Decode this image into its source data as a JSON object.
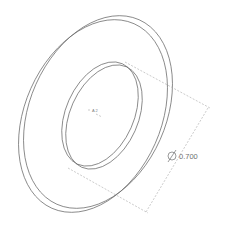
{
  "drawing": {
    "part": "washer",
    "view": "isometric",
    "dimension": {
      "symbol": "diameter",
      "value": "0.700"
    },
    "origin_label": "A 2",
    "colors": {
      "edge": "#6a6a6a",
      "dimension": "#a8a8a8",
      "background": "#ffffff"
    }
  }
}
